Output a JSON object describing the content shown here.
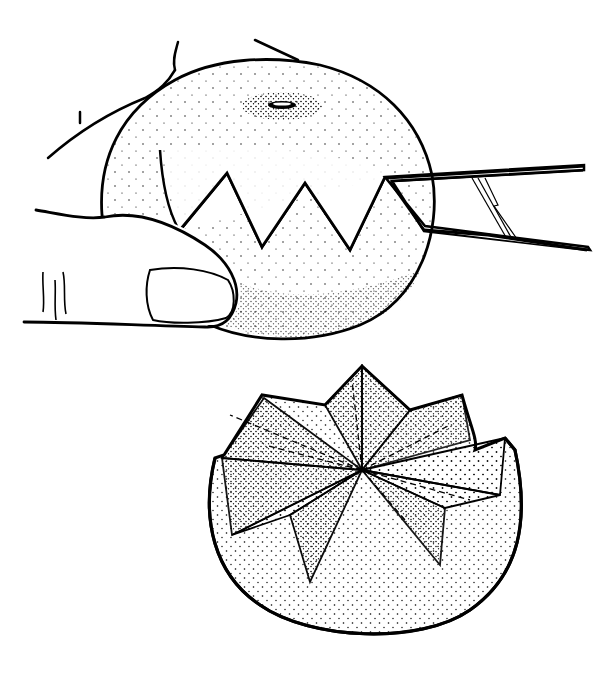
{
  "illustration": {
    "panels": [
      {
        "id": "top",
        "subject": "hand-holding-orange-knife-cutting-zigzag"
      },
      {
        "id": "bottom",
        "subject": "opened-orange-with-petal-segments"
      }
    ],
    "colors": {
      "ink": "#000000",
      "paper": "#ffffff"
    }
  }
}
